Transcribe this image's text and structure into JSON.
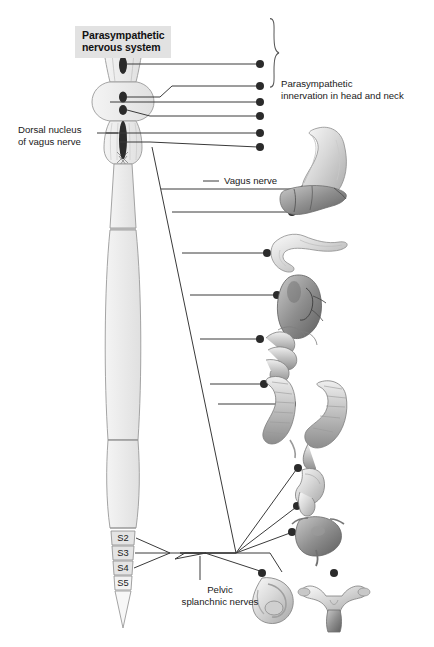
{
  "figure": {
    "title": "Parasympathetic\nnervous system",
    "background_color": "#ffffff",
    "title_box_color": "#e2e2e2",
    "line_color": "#3a3a3a",
    "cord_fill": "#ededed",
    "cord_stroke": "#9a9a9a",
    "nucleus_color": "#2b2b2b"
  },
  "labels": {
    "dorsal_nucleus": "Dorsal nucleus\nof vagus nerve",
    "head_and_neck": "Parasympathetic\ninnervation in head and neck",
    "vagus_nerve": "Vagus nerve",
    "pelvic_splanchnic": "Pelvic\nsplanchnic nerves"
  },
  "spinal_segments": [
    {
      "label": "S2"
    },
    {
      "label": "S3"
    },
    {
      "label": "S4"
    },
    {
      "label": "S5"
    }
  ],
  "cranial_nuclei": [
    {
      "name": "edinger-westphal-nucleus"
    },
    {
      "name": "superior-salivatory-nucleus"
    },
    {
      "name": "inferior-salivatory-nucleus"
    },
    {
      "name": "dorsal-nucleus-of-vagus-nerve"
    }
  ],
  "head_neck_targets": [
    {
      "name": "target-dot-1"
    },
    {
      "name": "target-dot-2"
    },
    {
      "name": "target-dot-3"
    },
    {
      "name": "target-dot-4"
    },
    {
      "name": "target-dot-5"
    },
    {
      "name": "target-dot-6"
    }
  ],
  "organs": [
    {
      "name": "stomach"
    },
    {
      "name": "liver"
    },
    {
      "name": "pancreas-duodenum"
    },
    {
      "name": "kidney"
    },
    {
      "name": "small-intestine"
    },
    {
      "name": "ascending-colon"
    },
    {
      "name": "descending-sigmoid-colon"
    },
    {
      "name": "rectum"
    },
    {
      "name": "urinary-bladder"
    },
    {
      "name": "male-internal-genitalia"
    },
    {
      "name": "uterus-and-ovaries"
    }
  ]
}
